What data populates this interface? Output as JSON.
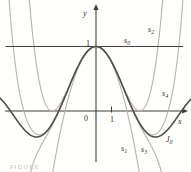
{
  "figure": {
    "caption_fragment": "FIGURE"
  },
  "chart_data": {
    "type": "line",
    "xlabel": "x",
    "ylabel": "y",
    "grid": false,
    "x_visible_range": [
      -6.25,
      6.25
    ],
    "y_visible_range": [
      -0.95,
      1.72
    ],
    "origin_label": "0",
    "x_axis_ticks": [
      {
        "value": 1,
        "label": "1"
      }
    ],
    "y_axis_ticks": [
      {
        "value": 1,
        "label": "1"
      }
    ],
    "series_formula": "s_n(x) = sum_{k=0..n} (-1)^k x^(2k) / (4^k (k!)^2) ; J0(x) is the limit of s_n(x)",
    "series": [
      {
        "name": "s0",
        "kind": "taylor_partial_sum",
        "order": 0,
        "label": {
          "base": "s",
          "sub": "0"
        },
        "color": "#44413c",
        "width": 1.1,
        "layer": 2,
        "x_px_range": [
          6,
          183
        ]
      },
      {
        "name": "s1",
        "kind": "taylor_partial_sum",
        "order": 1,
        "label": {
          "base": "s",
          "sub": "1"
        },
        "color": "#bab6af",
        "width": 1.15,
        "layer": 1
      },
      {
        "name": "s2",
        "kind": "taylor_partial_sum",
        "order": 2,
        "label": {
          "base": "s",
          "sub": "2"
        },
        "color": "#bab6af",
        "width": 1.15,
        "layer": 1
      },
      {
        "name": "s3",
        "kind": "taylor_partial_sum",
        "order": 3,
        "label": {
          "base": "s",
          "sub": "3"
        },
        "color": "#bab6af",
        "width": 1.15,
        "layer": 1
      },
      {
        "name": "s4",
        "kind": "taylor_partial_sum",
        "order": 4,
        "label": {
          "base": "s",
          "sub": "4"
        },
        "color": "#bab6af",
        "width": 1.15,
        "layer": 1
      },
      {
        "name": "J0",
        "kind": "bessel_j0",
        "order": 25,
        "label": {
          "base": "J",
          "sub": "0"
        },
        "color": "#534f48",
        "width": 1.6,
        "layer": 3
      }
    ],
    "j0_reference_points": [
      {
        "x": 0,
        "y": 1
      },
      {
        "x": 2.405,
        "y": 0
      },
      {
        "x": 3.832,
        "y": -0.403
      },
      {
        "x": 5.52,
        "y": 0
      }
    ],
    "layout": {
      "origin_px": {
        "x": 96,
        "y": 111
      },
      "px_per_unit": {
        "x": 15.5,
        "y": 64.5
      },
      "axis_color": "#3e3c38",
      "label_color": "#33312d",
      "x_axis_px": {
        "x1": 5,
        "x2": 183
      },
      "y_axis_px": {
        "y1": 9,
        "y2": 162
      },
      "sample_step": 0.04
    },
    "labels_px": [
      {
        "name": "y-axis-label",
        "base": "y",
        "italic": true,
        "x": 83,
        "y": 16
      },
      {
        "name": "y-tick-1",
        "base": "1",
        "italic": false,
        "x": 86,
        "y": 45.5
      },
      {
        "name": "s0",
        "base": "s",
        "sub": "0",
        "italic": true,
        "x": 124,
        "y": 43
      },
      {
        "name": "s2",
        "base": "s",
        "sub": "2",
        "italic": true,
        "x": 148,
        "y": 32
      },
      {
        "name": "s4",
        "base": "s",
        "sub": "4",
        "italic": true,
        "x": 162,
        "y": 96
      },
      {
        "name": "origin",
        "base": "0",
        "italic": false,
        "x": 84,
        "y": 121
      },
      {
        "name": "x-tick-1",
        "base": "1",
        "italic": false,
        "x": 110,
        "y": 122
      },
      {
        "name": "x-axis-label",
        "base": "x",
        "italic": true,
        "x": 178,
        "y": 124
      },
      {
        "name": "s1",
        "base": "s",
        "sub": "1",
        "italic": true,
        "x": 121,
        "y": 151
      },
      {
        "name": "s3",
        "base": "s",
        "sub": "3",
        "italic": true,
        "x": 141,
        "y": 152
      },
      {
        "name": "J0",
        "base": "J",
        "sub": "0",
        "italic": true,
        "x": 166,
        "y": 142
      }
    ]
  }
}
